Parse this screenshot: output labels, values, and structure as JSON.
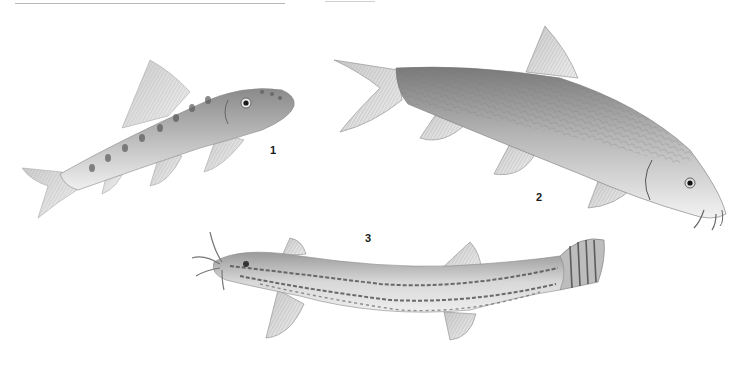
{
  "plate": {
    "figures": [
      {
        "number": "1",
        "description": "small spotted loach-like fish, facing right, upper left"
      },
      {
        "number": "2",
        "description": "barbel with barbels and scaled body, facing right, upper right"
      },
      {
        "number": "3",
        "description": "elongated striped loach with barbels, facing left, bottom center"
      }
    ]
  }
}
